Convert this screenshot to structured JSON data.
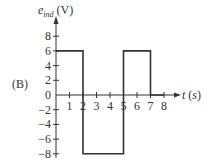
{
  "chart_data": {
    "type": "line",
    "title": "",
    "panel_label": "(B)",
    "xlabel": "t (s)",
    "ylabel": "e_ind (V)",
    "ylabel_main": "e",
    "ylabel_sub": "ind",
    "ylabel_unit": "(V)",
    "xlabel_var": "t",
    "xlabel_unit": "(s)",
    "xlim": [
      0,
      8
    ],
    "ylim": [
      -8,
      8
    ],
    "x_ticks": [
      1,
      2,
      3,
      4,
      5,
      6,
      7,
      8
    ],
    "y_ticks": [
      8,
      6,
      4,
      2,
      0,
      -2,
      -4,
      -6,
      -8
    ],
    "y_tick_labels": [
      "8",
      "6",
      "4",
      "2",
      "0",
      "−2",
      "−4",
      "−6",
      "−8"
    ],
    "grid": false,
    "series": [
      {
        "name": "e_ind",
        "step_segments": [
          {
            "t_start": 0,
            "t_end": 2,
            "value": 6
          },
          {
            "t_start": 2,
            "t_end": 5,
            "value": -8
          },
          {
            "t_start": 5,
            "t_end": 7,
            "value": 6
          },
          {
            "t_start": 7,
            "t_end": 8,
            "value": 0
          }
        ],
        "x": [
          0,
          2,
          2,
          5,
          5,
          7,
          7,
          8
        ],
        "y": [
          6,
          6,
          -8,
          -8,
          6,
          6,
          0,
          0
        ],
        "color": "#333333"
      }
    ]
  }
}
